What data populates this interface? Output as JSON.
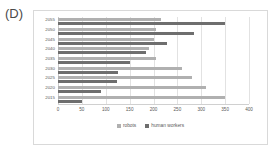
{
  "panel": {
    "letter": "(D)"
  },
  "chart_data": {
    "type": "bar",
    "orientation": "horizontal",
    "title": "",
    "xlabel": "",
    "ylabel": "",
    "xlim": [
      0,
      400
    ],
    "xticks": [
      0,
      50,
      100,
      150,
      200,
      250,
      300,
      350,
      400
    ],
    "categories": [
      "2055",
      "2050",
      "2045",
      "2040",
      "2035",
      "2030",
      "2025",
      "2020",
      "2015"
    ],
    "grid": true,
    "legend_position": "bottom",
    "series": [
      {
        "name": "robots",
        "color": "#b0b0b0",
        "values": [
          215,
          205,
          200,
          190,
          205,
          260,
          280,
          310,
          350
        ]
      },
      {
        "name": "human workers",
        "color": "#6e6e6e",
        "values": [
          350,
          285,
          228,
          185,
          150,
          125,
          123,
          90,
          50
        ]
      }
    ]
  }
}
